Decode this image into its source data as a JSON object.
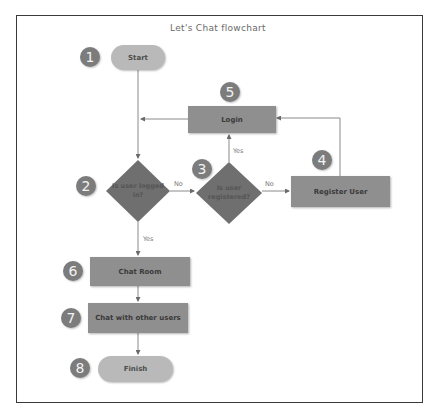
{
  "title": "Let's Chat flowchart",
  "colors": {
    "terminal_fill": "#b9b9b9",
    "process_fill": "#8f8f8f",
    "decision_fill": "#6f6f6f",
    "badge_fill": "#7c7c7c",
    "line": "#8a8a8a",
    "frame": "#3a3a3a"
  },
  "nodes": {
    "start": {
      "label": "Start",
      "shape": "terminal",
      "step": "1"
    },
    "logged_in": {
      "label": "Is user logged in?",
      "line1": "Is user logged",
      "line2": "in?",
      "shape": "decision",
      "step": "2"
    },
    "registered": {
      "label": "Is user registered?",
      "line1": "Is user",
      "line2": "registered?",
      "shape": "decision",
      "step": "3"
    },
    "register": {
      "label": "Register User",
      "shape": "process",
      "step": "4"
    },
    "login": {
      "label": "Login",
      "shape": "process",
      "step": "5"
    },
    "chat_room": {
      "label": "Chat Room",
      "shape": "process",
      "step": "6"
    },
    "chat_users": {
      "label": "Chat with other users",
      "shape": "process",
      "step": "7"
    },
    "finish": {
      "label": "Finish",
      "shape": "terminal",
      "step": "8"
    }
  },
  "edges": {
    "logged_in_no": "No",
    "registered_no": "No",
    "registered_yes": "Yes",
    "logged_in_yes": "Yes"
  }
}
